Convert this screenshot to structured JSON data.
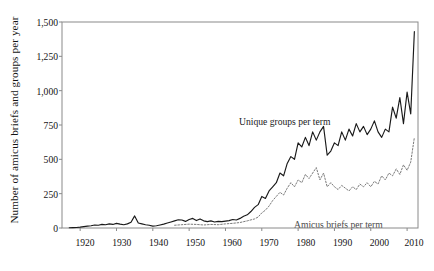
{
  "figure": {
    "background_color": "#ffffff",
    "frame_color": "#7d7d7d"
  },
  "axes": {
    "y_axis_title": "Number of amicus briefs and groups per year",
    "y_ticks": [
      "0",
      "250",
      "500",
      "750",
      "1,000",
      "1,250",
      "1,500"
    ],
    "x_ticks": [
      "1920",
      "1930",
      "1940",
      "1950",
      "1960",
      "1970",
      "1980",
      "1990",
      "2000",
      "2010"
    ]
  },
  "annotations": {
    "solid_series_label": "Unique groups per term",
    "dotted_series_label": "Amicus briefs per term"
  },
  "chart_data": {
    "type": "line",
    "title": "",
    "xlabel": "",
    "ylabel": "Number of amicus briefs and groups per year",
    "xlim": [
      1915,
      2013
    ],
    "ylim": [
      0,
      1500
    ],
    "ytick_values": [
      0,
      250,
      500,
      750,
      1000,
      1250,
      1500
    ],
    "xtick_values": [
      1920,
      1930,
      1940,
      1950,
      1960,
      1970,
      1980,
      1990,
      2000,
      2010
    ],
    "grid": false,
    "legend": "inline-annotations",
    "series": [
      {
        "name": "Unique groups per term",
        "style": "solid",
        "color": "#1a1a1a",
        "x": [
          1917,
          1918,
          1919,
          1920,
          1921,
          1922,
          1923,
          1924,
          1925,
          1926,
          1927,
          1928,
          1929,
          1930,
          1931,
          1932,
          1933,
          1934,
          1935,
          1936,
          1937,
          1938,
          1939,
          1940,
          1941,
          1942,
          1943,
          1944,
          1945,
          1946,
          1947,
          1948,
          1949,
          1950,
          1951,
          1952,
          1953,
          1954,
          1955,
          1956,
          1957,
          1958,
          1959,
          1960,
          1961,
          1962,
          1963,
          1964,
          1965,
          1966,
          1967,
          1968,
          1969,
          1970,
          1971,
          1972,
          1973,
          1974,
          1975,
          1976,
          1977,
          1978,
          1979,
          1980,
          1981,
          1982,
          1983,
          1984,
          1985,
          1986,
          1987,
          1988,
          1989,
          1990,
          1991,
          1992,
          1993,
          1994,
          1995,
          1996,
          1997,
          1998,
          1999,
          2000,
          2001,
          2002,
          2003,
          2004,
          2005,
          2006,
          2007,
          2008,
          2009,
          2010,
          2011,
          2012
        ],
        "y": [
          2,
          3,
          4,
          6,
          10,
          14,
          16,
          22,
          20,
          26,
          24,
          30,
          26,
          34,
          28,
          24,
          30,
          42,
          88,
          36,
          30,
          24,
          20,
          14,
          16,
          22,
          28,
          36,
          44,
          52,
          60,
          58,
          48,
          62,
          70,
          54,
          66,
          52,
          46,
          52,
          44,
          48,
          46,
          50,
          54,
          62,
          58,
          70,
          86,
          96,
          120,
          150,
          170,
          230,
          215,
          270,
          300,
          330,
          400,
          380,
          470,
          520,
          500,
          620,
          590,
          660,
          600,
          700,
          640,
          700,
          740,
          530,
          560,
          620,
          600,
          700,
          640,
          720,
          670,
          760,
          700,
          740,
          680,
          720,
          780,
          700,
          660,
          720,
          700,
          880,
          800,
          950,
          760,
          990,
          830,
          1430
        ]
      },
      {
        "name": "Amicus briefs per term",
        "style": "dotted",
        "color": "#7a7a7a",
        "x": [
          1946,
          1948,
          1950,
          1952,
          1954,
          1956,
          1958,
          1960,
          1962,
          1964,
          1966,
          1968,
          1969,
          1970,
          1971,
          1972,
          1973,
          1974,
          1975,
          1976,
          1977,
          1978,
          1979,
          1980,
          1981,
          1982,
          1983,
          1984,
          1985,
          1986,
          1987,
          1988,
          1989,
          1990,
          1991,
          1992,
          1993,
          1994,
          1995,
          1996,
          1997,
          1998,
          1999,
          2000,
          2001,
          2002,
          2003,
          2004,
          2005,
          2006,
          2007,
          2008,
          2009,
          2010,
          2011,
          2012
        ],
        "y": [
          20,
          24,
          28,
          26,
          22,
          26,
          24,
          30,
          34,
          40,
          52,
          66,
          80,
          110,
          130,
          160,
          200,
          230,
          260,
          240,
          290,
          330,
          300,
          350,
          330,
          390,
          360,
          400,
          440,
          350,
          400,
          300,
          330,
          300,
          280,
          310,
          290,
          270,
          300,
          280,
          320,
          300,
          330,
          300,
          340,
          320,
          380,
          350,
          400,
          380,
          430,
          390,
          460,
          420,
          480,
          660
        ]
      }
    ]
  }
}
